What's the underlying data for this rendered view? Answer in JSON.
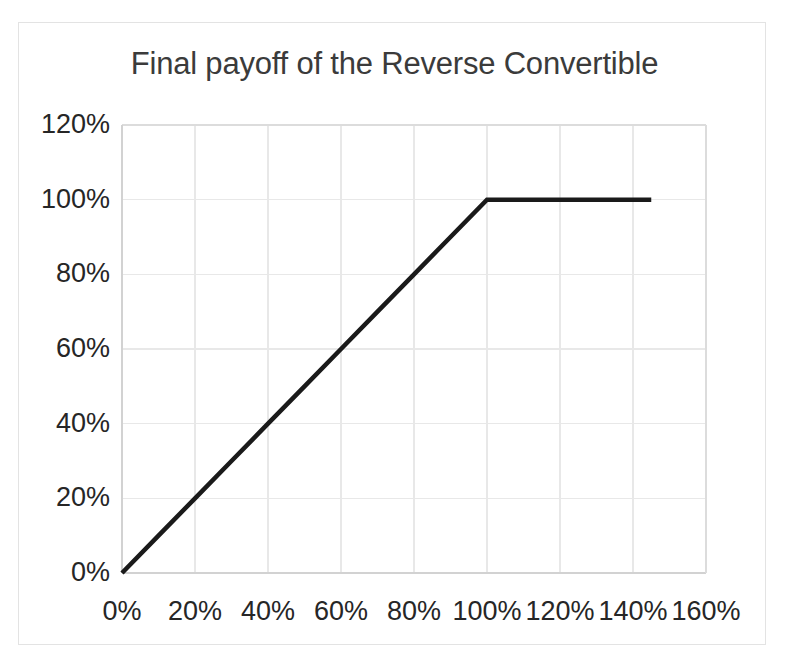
{
  "figure": {
    "title": "Final payoff of the Reverse Convertible",
    "background_color": "#ffffff",
    "frame_color": "#e3e3e3",
    "tick_label_color": "#262626",
    "title_color": "#3b3b3b"
  },
  "chart_data": {
    "type": "line",
    "title": "Final payoff of the Reverse Convertible",
    "xlabel": "",
    "ylabel": "",
    "xlim": [
      0,
      160
    ],
    "ylim": [
      0,
      120
    ],
    "grid": true,
    "legend": "none",
    "line_color": "#1a1a1a",
    "line_width": 4.5,
    "x_tick_labels": [
      "0%",
      "20%",
      "40%",
      "60%",
      "80%",
      "100%",
      "120%",
      "140%",
      "160%"
    ],
    "x_tick_values": [
      0,
      20,
      40,
      60,
      80,
      100,
      120,
      140,
      160
    ],
    "y_tick_labels": [
      "0%",
      "20%",
      "40%",
      "60%",
      "80%",
      "100%",
      "120%"
    ],
    "y_tick_values": [
      0,
      20,
      40,
      60,
      80,
      100,
      120
    ],
    "series": [
      {
        "name": "Final payoff",
        "x": [
          0,
          10,
          20,
          30,
          40,
          50,
          60,
          70,
          80,
          90,
          100,
          110,
          120,
          130,
          140,
          145
        ],
        "values": [
          0,
          10,
          20,
          30,
          40,
          50,
          60,
          70,
          80,
          90,
          100,
          100,
          100,
          100,
          100,
          100
        ]
      }
    ],
    "annotations": [
      {
        "label": "kink",
        "x": 100,
        "y": 100
      }
    ]
  }
}
